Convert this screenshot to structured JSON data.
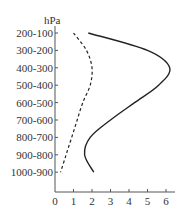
{
  "chart_data": {
    "type": "line",
    "title": "",
    "xlabel": "",
    "ylabel": "hPa",
    "xlim": [
      0,
      6.5
    ],
    "x_ticks": [
      "0",
      "1",
      "2",
      "3",
      "4",
      "5",
      "6"
    ],
    "categories": [
      "200-100",
      "300-200",
      "400-300",
      "500-400",
      "600-500",
      "700-600",
      "800-700",
      "900-800",
      "1000-900"
    ],
    "grid": false,
    "legend": null,
    "series": [
      {
        "name": "solid",
        "style": "solid",
        "values": [
          1.8,
          5.0,
          6.2,
          5.6,
          4.3,
          3.0,
          1.9,
          1.6,
          2.1
        ]
      },
      {
        "name": "dashed",
        "style": "dashed",
        "values": [
          1.0,
          1.7,
          2.0,
          1.9,
          1.5,
          1.2,
          0.9,
          0.6,
          0.3
        ]
      }
    ],
    "colors": {
      "line": "#222222",
      "axis": "#555555"
    }
  }
}
